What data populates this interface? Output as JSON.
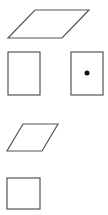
{
  "canvas": {
    "width": 108,
    "height": 215,
    "background": "#ffffff"
  },
  "stroke_color": "#555555",
  "dot_color": "#111111",
  "shapes": [
    {
      "id": "large-parallelogram",
      "type": "parallelogram",
      "points": "35,10 89,10 62,38 8,38"
    },
    {
      "id": "left-rectangle",
      "type": "rectangle",
      "x": 8,
      "y": 52,
      "width": 32,
      "height": 43
    },
    {
      "id": "right-rectangle-with-dot",
      "type": "rectangle",
      "x": 71,
      "y": 52,
      "width": 32,
      "height": 43,
      "dot": {
        "cx": 87,
        "cy": 73,
        "r": 2.5
      }
    },
    {
      "id": "small-parallelogram",
      "type": "parallelogram",
      "points": "23,124 58,124 42,151 7,151"
    },
    {
      "id": "small-square",
      "type": "rectangle",
      "x": 7,
      "y": 178,
      "width": 33,
      "height": 31
    }
  ]
}
